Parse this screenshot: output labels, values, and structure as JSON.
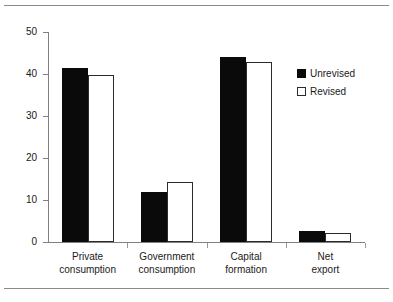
{
  "figure": {
    "top_rule": "",
    "bottom_rule": ""
  },
  "chart_data": {
    "type": "bar",
    "title": "",
    "subtitle": "",
    "xlabel": "",
    "ylabel": "",
    "ylim": [
      0,
      50
    ],
    "yticks": [
      0,
      10,
      20,
      30,
      40,
      50
    ],
    "ytick_labels": [
      "0",
      "10",
      "20",
      "30",
      "40",
      "50"
    ],
    "grid": false,
    "legend_position": "upper right (inside plot)",
    "categories": [
      "Private consumption",
      "Government consumption",
      "Capital formation",
      "Net export"
    ],
    "category_lines": [
      [
        "Private",
        "consumption"
      ],
      [
        "Government",
        "consumption"
      ],
      [
        "Capital",
        "formation"
      ],
      [
        "Net",
        "export"
      ]
    ],
    "series": [
      {
        "name": "Unrevised",
        "color": "#0a0a0a",
        "fill": "solid",
        "values": [
          41.5,
          11.8,
          44.0,
          2.6
        ]
      },
      {
        "name": "Revised",
        "color": "#ffffff",
        "fill": "hollow",
        "values": [
          39.8,
          14.3,
          42.8,
          2.2
        ]
      }
    ]
  },
  "legend": {
    "items": [
      {
        "label": "Unrevised",
        "swatch": "filled-square-icon"
      },
      {
        "label": "Revised",
        "swatch": "hollow-square-icon"
      }
    ]
  }
}
